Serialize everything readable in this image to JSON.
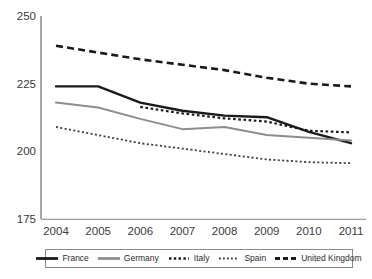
{
  "chart_data": {
    "type": "line",
    "title": "",
    "subtitle": "",
    "xlabel": "",
    "ylabel": "",
    "categories": [
      "2004",
      "2005",
      "2006",
      "2007",
      "2008",
      "2009",
      "2010",
      "2011"
    ],
    "x_tick_labels": [
      "2004",
      "2005",
      "2006",
      "2007",
      "2008",
      "2009",
      "2010",
      "2011"
    ],
    "y_tick_labels": [
      "250",
      "225",
      "200",
      "175"
    ],
    "y_ticks": [
      250,
      225,
      200,
      175
    ],
    "ylim": [
      175,
      250
    ],
    "grid": false,
    "legend_position": "bottom",
    "series": [
      {
        "name": "France",
        "style": "solid",
        "color": "#1a1a1a",
        "width": 2.4,
        "values": [
          224.0,
          224.0,
          218.0,
          215.0,
          213.2,
          212.6,
          207.2,
          203.0
        ]
      },
      {
        "name": "Germany",
        "style": "solid",
        "color": "#8d8d8d",
        "width": 2.0,
        "values": [
          218.0,
          216.2,
          212.0,
          208.2,
          209.0,
          206.0,
          205.0,
          204.0
        ]
      },
      {
        "name": "Italy",
        "style": "dotted-thick",
        "color": "#1a1a1a",
        "width": 2.2,
        "values": [
          null,
          null,
          216.4,
          214.0,
          212.2,
          211.0,
          207.6,
          207.0
        ]
      },
      {
        "name": "Spain",
        "style": "dotted-fine",
        "color": "#3d3d3d",
        "width": 1.8,
        "values": [
          209.0,
          206.0,
          203.0,
          201.0,
          199.0,
          197.0,
          196.0,
          195.6
        ]
      },
      {
        "name": "United Kingdom",
        "style": "dashed",
        "color": "#1a1a1a",
        "width": 2.6,
        "values": [
          239.0,
          236.5,
          234.0,
          232.0,
          230.0,
          227.2,
          225.0,
          224.0
        ]
      }
    ]
  },
  "axis": {
    "y_labels": [
      "250",
      "225",
      "200",
      "175"
    ],
    "x_labels": [
      "2004",
      "2005",
      "2006",
      "2007",
      "2008",
      "2009",
      "2010",
      "2011"
    ]
  },
  "legend": {
    "items": [
      {
        "label": "France",
        "swatch": "solid-black-line-swatch"
      },
      {
        "label": "Germany",
        "swatch": "solid-gray-line-swatch"
      },
      {
        "label": "Italy",
        "swatch": "thick-dotted-line-swatch"
      },
      {
        "label": "Spain",
        "swatch": "fine-dotted-line-swatch"
      },
      {
        "label": "United Kingdom",
        "swatch": "dashed-line-swatch"
      }
    ]
  },
  "colors": {
    "france": "#1a1a1a",
    "germany": "#8d8d8d",
    "italy": "#1a1a1a",
    "spain": "#3d3d3d",
    "united_kingdom": "#1a1a1a",
    "axis": "#777777",
    "text": "#3a3a3a",
    "background": "#ffffff"
  }
}
